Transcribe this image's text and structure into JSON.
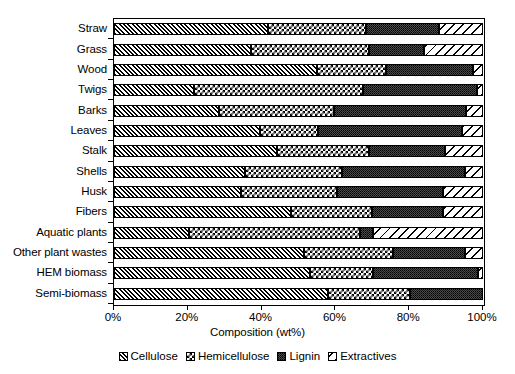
{
  "chart_data": {
    "type": "bar",
    "subtype": "stacked-horizontal-100-percent",
    "title": "",
    "xlabel": "Composition (wt%)",
    "ylabel": "",
    "xlim": [
      0,
      100
    ],
    "xticks": [
      "0%",
      "20%",
      "40%",
      "60%",
      "80%",
      "100%"
    ],
    "xtick_values": [
      0,
      20,
      40,
      60,
      80,
      100
    ],
    "grid": false,
    "legend_position": "bottom",
    "categories": [
      "Straw",
      "Grass",
      "Wood",
      "Twigs",
      "Barks",
      "Leaves",
      "Stalk",
      "Shells",
      "Husk",
      "Fibers",
      "Aquatic plants",
      "Other plant wastes",
      "HEM biomass",
      "Semi-biomass"
    ],
    "series": [
      {
        "name": "Cellulose",
        "pattern": "diagonal-hatch-right",
        "values": [
          41.6,
          37.0,
          55.0,
          21.6,
          28.4,
          39.7,
          44.3,
          35.4,
          34.3,
          48.1,
          20.3,
          51.4,
          53.0,
          58.1
        ]
      },
      {
        "name": "Hemicellulose",
        "pattern": "checkerboard",
        "values": [
          26.8,
          32.0,
          18.8,
          46.0,
          31.3,
          15.7,
          24.7,
          26.5,
          26.2,
          21.9,
          46.5,
          24.3,
          17.3,
          22.2
        ]
      },
      {
        "name": "Lignin",
        "pattern": "dense-dots",
        "values": [
          19.6,
          15.0,
          23.5,
          30.8,
          35.7,
          38.9,
          20.7,
          33.2,
          28.7,
          19.2,
          3.5,
          19.4,
          28.3,
          19.7
        ]
      },
      {
        "name": "Extractives",
        "pattern": "diagonal-stripes-left",
        "values": [
          12.0,
          16.0,
          2.7,
          1.6,
          4.6,
          5.7,
          10.3,
          4.9,
          10.8,
          10.8,
          29.7,
          4.9,
          1.4,
          0.0
        ]
      }
    ]
  },
  "legend": {
    "items": [
      {
        "label": "Cellulose"
      },
      {
        "label": "Hemicellulose"
      },
      {
        "label": "Lignin"
      },
      {
        "label": "Extractives"
      }
    ]
  }
}
